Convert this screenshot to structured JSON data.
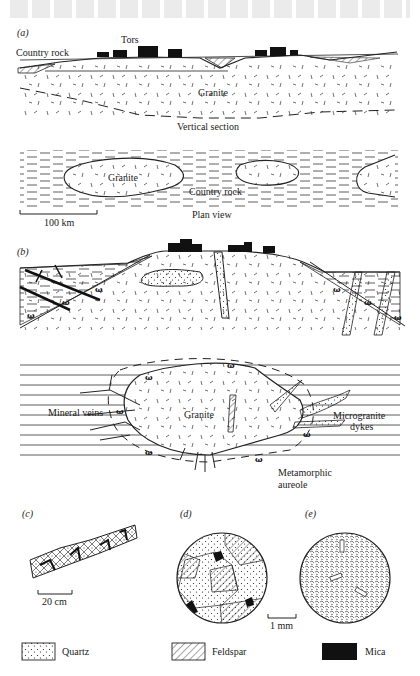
{
  "figure": {
    "panels": [
      {
        "id": "a",
        "label": "(a)"
      },
      {
        "id": "b",
        "label": "(b)"
      },
      {
        "id": "c",
        "label": "(c)"
      },
      {
        "id": "d",
        "label": "(d)"
      },
      {
        "id": "e",
        "label": "(e)"
      }
    ],
    "a": {
      "vertical_section": {
        "labels": {
          "tors": "Tors",
          "country_rock": "Country rock",
          "granite": "Granite"
        },
        "caption": "Vertical section"
      },
      "plan_view": {
        "labels": {
          "granite": "Granite",
          "country_rock": "Country rock"
        },
        "caption": "Plan view",
        "scale_bar": "100 km"
      }
    },
    "b": {
      "plan_labels": {
        "mineral_veins": "Mineral veins",
        "granite": "Granite",
        "microgranite_line1": "Microgranite",
        "microgranite_line2": "dykes",
        "aureole_line1": "Metamorphic",
        "aureole_line2": "aureole"
      }
    },
    "c": {
      "scale_bar": "20 cm"
    },
    "d": {
      "scale_bar": "1 mm"
    },
    "legend": [
      {
        "name": "Quartz",
        "pattern": "dots"
      },
      {
        "name": "Feldspar",
        "pattern": "hatch"
      },
      {
        "name": "Mica",
        "pattern": "solid",
        "color": "#111111"
      }
    ]
  }
}
